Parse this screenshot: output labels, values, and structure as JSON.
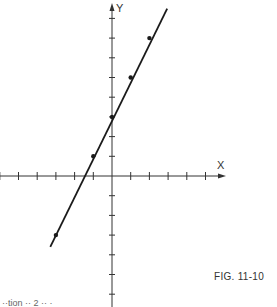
{
  "figure": {
    "caption": "FIG. 11-10",
    "bottom_cut_text": "··tion  ··  2 ·· ·"
  },
  "chart_data": {
    "type": "line",
    "title": "",
    "xlabel": "X",
    "ylabel": "Y",
    "equation": "y = 2x + 3",
    "series": [
      {
        "name": "line",
        "x": [
          -3,
          -1,
          0,
          1,
          2
        ],
        "y": [
          -3,
          1,
          3,
          5,
          7
        ]
      }
    ],
    "xlim": [
      -6,
      6
    ],
    "ylim": [
      -7,
      9
    ],
    "x_ticks": [
      -6,
      -5,
      -4,
      -3,
      -2,
      -1,
      1,
      2,
      3,
      4,
      5
    ],
    "y_ticks": [
      -6,
      -5,
      -4,
      -3,
      -2,
      -1,
      1,
      2,
      3,
      4,
      5,
      6,
      7,
      8
    ],
    "grid": false,
    "legend": "none",
    "tick_labels_shown": false
  },
  "layout": {
    "origin_px": [
      112,
      176
    ],
    "unit_x_px": 18.7,
    "unit_y_px": 19.7,
    "line_start": [
      -3.3,
      -3.6
    ],
    "line_end": [
      2.95,
      8.5
    ],
    "x_axis_px_range": [
      0,
      226
    ],
    "y_axis_px_range": [
      3,
      307
    ],
    "colors": {
      "ink": "#1a1a1a",
      "axis": "#333333",
      "background": "#ffffff"
    }
  }
}
